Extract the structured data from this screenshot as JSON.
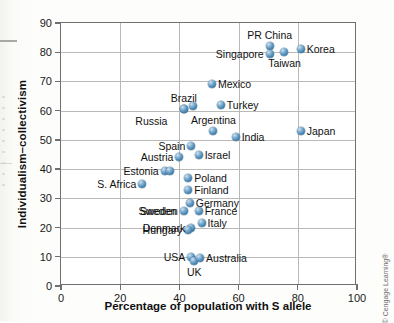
{
  "chart_data": {
    "type": "scatter",
    "title": "",
    "xlabel": "Percentage of population with S allele",
    "ylabel": "Individualism–collectivism",
    "xlim": [
      0,
      100
    ],
    "ylim": [
      0,
      90
    ],
    "xticks": [
      0,
      20,
      40,
      60,
      80,
      100
    ],
    "yticks": [
      0,
      10,
      20,
      30,
      40,
      50,
      60,
      70,
      80,
      90
    ],
    "grid": true,
    "legend": null,
    "marker_color": "#4a87b4",
    "points": [
      {
        "label": "PR China",
        "x": 70.5,
        "y": 82.0,
        "label_pos": "above"
      },
      {
        "label": "Singapore",
        "x": 70.5,
        "y": 79.5,
        "label_pos": "left"
      },
      {
        "label": "Taiwan",
        "x": 75.5,
        "y": 80.0,
        "label_pos": "below"
      },
      {
        "label": "Korea",
        "x": 81.0,
        "y": 81.0,
        "label_pos": "right"
      },
      {
        "label": "Mexico",
        "x": 51.0,
        "y": 69.0,
        "label_pos": "right"
      },
      {
        "label": "Brazil",
        "x": 41.5,
        "y": 60.5,
        "label_pos": "above"
      },
      {
        "label": "Brazil2",
        "x": 44.5,
        "y": 61.5,
        "label_pos": "none"
      },
      {
        "label": "Turkey",
        "x": 54.0,
        "y": 62.0,
        "label_pos": "right"
      },
      {
        "label": "Russia",
        "x": 41.5,
        "y": 60.5,
        "label_pos": "none"
      },
      {
        "label": "Argentina",
        "x": 51.5,
        "y": 53.0,
        "label_pos": "above"
      },
      {
        "label": "India",
        "x": 59.0,
        "y": 51.0,
        "label_pos": "right"
      },
      {
        "label": "Japan",
        "x": 81.0,
        "y": 53.0,
        "label_pos": "right"
      },
      {
        "label": "Spain",
        "x": 44.0,
        "y": 48.0,
        "label_pos": "left"
      },
      {
        "label": "Israel",
        "x": 46.5,
        "y": 45.0,
        "label_pos": "right"
      },
      {
        "label": "Austria",
        "x": 40.0,
        "y": 44.0,
        "label_pos": "left"
      },
      {
        "label": "Estonia",
        "x": 35.0,
        "y": 39.5,
        "label_pos": "left"
      },
      {
        "label": "Estonia2",
        "x": 36.8,
        "y": 39.5,
        "label_pos": "none"
      },
      {
        "label": "S. Africa",
        "x": 27.5,
        "y": 35.0,
        "label_pos": "left"
      },
      {
        "label": "Poland",
        "x": 43.0,
        "y": 37.0,
        "label_pos": "right"
      },
      {
        "label": "Finland",
        "x": 43.0,
        "y": 33.0,
        "label_pos": "right"
      },
      {
        "label": "Germany",
        "x": 43.5,
        "y": 28.5,
        "label_pos": "right"
      },
      {
        "label": "France",
        "x": 46.5,
        "y": 25.5,
        "label_pos": "right"
      },
      {
        "label": "Italy",
        "x": 47.5,
        "y": 21.5,
        "label_pos": "right"
      },
      {
        "label": "Sweden",
        "x": 41.5,
        "y": 25.5,
        "label_pos": "left"
      },
      {
        "label": "Denmark",
        "x": 44.0,
        "y": 20.0,
        "label_pos": "left"
      },
      {
        "label": "Hungary",
        "x": 43.0,
        "y": 19.0,
        "label_pos": "left"
      },
      {
        "label": "USA",
        "x": 44.0,
        "y": 10.0,
        "label_pos": "left"
      },
      {
        "label": "UK",
        "x": 45.0,
        "y": 8.5,
        "label_pos": "below"
      },
      {
        "label": "Australia",
        "x": 47.0,
        "y": 9.5,
        "label_pos": "right"
      }
    ]
  },
  "footer": {
    "copyright": "© Cengage Learning®"
  }
}
